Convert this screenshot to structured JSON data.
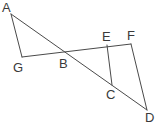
{
  "figure": {
    "type": "geometry-diagram",
    "width": 159,
    "height": 126,
    "background_color": "#ffffff",
    "stroke_color": "#4a4a4a",
    "stroke_width": 1,
    "label_color": "#3a3a3a",
    "points": {
      "A": {
        "label": "A",
        "x": 11,
        "y": 14,
        "label_x": 2,
        "label_y": 1
      },
      "B": {
        "label": "B",
        "x": 62,
        "y": 50,
        "label_x": 59,
        "label_y": 57
      },
      "C": {
        "label": "C",
        "x": 112,
        "y": 85,
        "label_x": 106,
        "label_y": 88
      },
      "D": {
        "label": "D",
        "x": 147,
        "y": 110,
        "label_x": 145,
        "label_y": 111
      },
      "E": {
        "label": "E",
        "x": 107,
        "y": 45,
        "label_x": 102,
        "label_y": 30
      },
      "F": {
        "label": "F",
        "x": 131,
        "y": 44,
        "label_x": 127,
        "label_y": 29
      },
      "G": {
        "label": "G",
        "x": 22,
        "y": 57,
        "label_x": 13,
        "label_y": 61
      }
    },
    "segments": [
      {
        "name": "segment-AG",
        "from": "A",
        "to": "G"
      },
      {
        "name": "segment-AD",
        "from": "A",
        "to": "D"
      },
      {
        "name": "segment-GF",
        "from": "G",
        "to": "F"
      },
      {
        "name": "segment-EC",
        "from": "E",
        "to": "C"
      },
      {
        "name": "segment-FD",
        "from": "F",
        "to": "D"
      }
    ]
  }
}
